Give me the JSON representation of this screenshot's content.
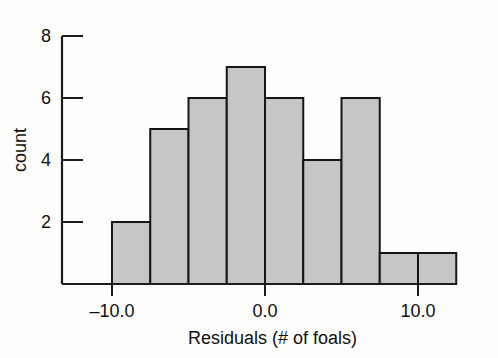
{
  "chart_data": {
    "type": "bar",
    "title": "",
    "subtitle": "",
    "xlabel": "Residuals (# of foals)",
    "ylabel": "count",
    "grid": false,
    "legend": null,
    "xlim": [
      -10.0,
      13.0
    ],
    "ylim": [
      0,
      8.6
    ],
    "bin_width": 2.5,
    "bin_edges": [
      -10.0,
      -7.5,
      -5.0,
      -2.5,
      0.0,
      2.5,
      5.0,
      7.5,
      10.0,
      12.5
    ],
    "categories": [
      "-10.0 to -7.5",
      "-7.5 to -5.0",
      "-5.0 to -2.5",
      "-2.5 to 0.0",
      "0.0 to 2.5",
      "2.5 to 5.0",
      "5.0 to 7.5",
      "7.5 to 10.0",
      "10.0 to 12.5"
    ],
    "values": [
      2,
      5,
      6,
      7,
      6,
      4,
      6,
      1,
      1
    ],
    "x_ticks": [
      -10.0,
      0.0,
      10.0
    ],
    "x_tick_labels": [
      "–10.0",
      "0.0",
      "10.0"
    ],
    "y_ticks": [
      2,
      4,
      6,
      8
    ],
    "y_tick_labels": [
      "2",
      "4",
      "6",
      "8"
    ],
    "bar_fill_color": "#c6c6c6",
    "bar_edge_color": "#161616",
    "axis_color": "#1c1c1c",
    "background_color": "#fdfdfc"
  },
  "axes": {
    "y_axis_title": "count",
    "x_axis_title": "Residuals (# of foals)"
  }
}
